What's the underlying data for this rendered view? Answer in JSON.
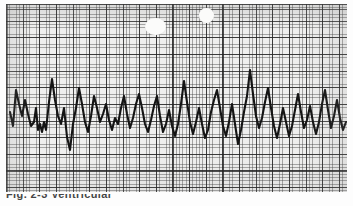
{
  "document": {
    "kind": "ecg-rhythm-strip",
    "title": "ECG rhythm strip on graph paper",
    "background_color": "#fdfdfd"
  },
  "paper": {
    "label": "ecg-graph-paper",
    "paper_color": "#efefee",
    "minor_grid_color": "#3c3c3c",
    "major_grid_color": "#1e1e1e",
    "minor_grid_px": 3.33,
    "major_grid_px": 16.65,
    "minor_per_major": 5,
    "x": 6,
    "y": 4,
    "width": 341,
    "height": 188
  },
  "trace": {
    "label": "ecg-waveform",
    "stroke_color": "#141414",
    "stroke_width": 2.1,
    "rhythm_description": "irregularly irregular chaotic complexes of varying amplitude",
    "baseline_y": 114,
    "path": "M 4 108 L 7 122 L 10 86 L 13 100 L 16 112 L 19 96 L 22 110 L 25 122 L 28 118 L 30 104 L 32 126 L 34 120 L 36 128 L 38 118 L 40 126 L 43 98 L 46 75 L 49 96 L 52 112 L 55 120 L 58 104 L 61 133 L 64 146 L 67 120 L 70 104 L 73 84 L 76 100 L 79 118 L 82 128 L 85 112 L 88 92 L 91 104 L 94 118 L 97 110 L 100 100 L 103 116 L 106 126 L 109 114 L 112 120 L 115 104 L 118 92 L 121 110 L 124 124 L 127 114 L 130 100 L 133 90 L 136 104 L 139 120 L 142 128 L 145 116 L 148 102 L 151 92 L 154 112 L 157 128 L 160 120 L 163 106 L 166 122 L 169 132 L 172 120 L 175 100 L 178 77 L 181 98 L 184 118 L 187 130 L 190 118 L 193 104 L 196 120 L 199 134 L 202 126 L 205 108 L 208 96 L 211 86 L 214 104 L 217 122 L 220 132 L 223 118 L 226 100 L 229 120 L 232 140 L 235 126 L 238 108 L 241 92 L 244 66 L 247 90 L 250 112 L 253 124 L 256 114 L 259 98 L 262 84 L 265 104 L 268 122 L 271 134 L 274 120 L 277 104 L 280 118 L 283 132 L 286 122 L 289 106 L 292 90 L 295 108 L 298 124 L 301 116 L 304 102 L 307 118 L 310 130 L 313 118 L 316 100 L 319 86 L 322 106 L 325 124 L 328 112 L 331 96 L 334 114 L 337 126 L 340 118"
  },
  "artifacts": [
    {
      "name": "white-blob-left",
      "x": 145,
      "y": 18,
      "width": 21,
      "height": 17,
      "color": "#fbfbfa"
    },
    {
      "name": "white-blob-right",
      "x": 199,
      "y": 8,
      "width": 15,
      "height": 15,
      "color": "#fbfbfa"
    }
  ],
  "caption": {
    "label": "cut-off-caption",
    "text": "Fig. 2-3   Ventricular",
    "legible": false,
    "color": "#262626"
  }
}
